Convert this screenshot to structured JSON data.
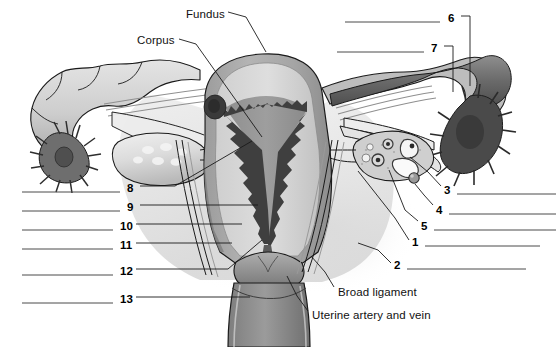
{
  "figure": {
    "type": "anatomy-worksheet-diagram",
    "palette": {
      "background": "#ffffff",
      "outline": "#1a1a1a",
      "tissue_light": "#e9e9e9",
      "tissue_midlight": "#d2d2d2",
      "tissue_mid": "#b0b0b0",
      "tissue_dark": "#8a8a8a",
      "tissue_darker": "#6d6d6d",
      "endometrium_dark": "#4a4a4a",
      "answer_line": "#4a4a4a",
      "leader_line": "#1a1a1a"
    }
  },
  "text_labels": [
    {
      "id": "fundus",
      "text": "Fundus",
      "x": 186,
      "y": 8
    },
    {
      "id": "corpus",
      "text": "Corpus",
      "x": 137,
      "y": 34
    },
    {
      "id": "broad-ligament",
      "text": "Broad ligament",
      "x": 338,
      "y": 286
    },
    {
      "id": "uterine-artery-and-vein",
      "text": "Uterine artery and vein",
      "x": 312,
      "y": 309
    }
  ],
  "numbered_labels": [
    {
      "number": "1",
      "x": 412,
      "y": 236,
      "side": "right"
    },
    {
      "number": "2",
      "x": 394,
      "y": 259,
      "side": "right"
    },
    {
      "number": "3",
      "x": 444,
      "y": 184,
      "side": "right"
    },
    {
      "number": "4",
      "x": 436,
      "y": 204,
      "side": "right"
    },
    {
      "number": "5",
      "x": 421,
      "y": 220,
      "side": "right"
    },
    {
      "number": "6",
      "x": 448,
      "y": 12,
      "side": "top-right"
    },
    {
      "number": "7",
      "x": 431,
      "y": 42,
      "side": "top-right"
    },
    {
      "number": "8",
      "x": 127,
      "y": 182,
      "side": "left"
    },
    {
      "number": "9",
      "x": 127,
      "y": 201,
      "side": "left"
    },
    {
      "number": "10",
      "x": 120,
      "y": 220,
      "side": "left"
    },
    {
      "number": "11",
      "x": 120,
      "y": 239,
      "side": "left"
    },
    {
      "number": "12",
      "x": 120,
      "y": 265,
      "side": "left"
    },
    {
      "number": "13",
      "x": 120,
      "y": 293,
      "side": "left"
    }
  ],
  "answer_lines": [
    {
      "for": "6",
      "x1": 345,
      "x2": 440,
      "y": 22
    },
    {
      "for": "7",
      "x1": 337,
      "x2": 424,
      "y": 52
    },
    {
      "for": "3",
      "x1": 457,
      "x2": 556,
      "y": 194
    },
    {
      "for": "4",
      "x1": 449,
      "x2": 556,
      "y": 214
    },
    {
      "for": "5",
      "x1": 434,
      "x2": 556,
      "y": 230
    },
    {
      "for": "1",
      "x1": 425,
      "x2": 540,
      "y": 246
    },
    {
      "for": "2",
      "x1": 407,
      "x2": 526,
      "y": 269
    },
    {
      "for": "8",
      "x1": 22,
      "x2": 120,
      "y": 192
    },
    {
      "for": "9",
      "x1": 22,
      "x2": 120,
      "y": 211
    },
    {
      "for": "10",
      "x1": 22,
      "x2": 113,
      "y": 230
    },
    {
      "for": "11",
      "x1": 22,
      "x2": 113,
      "y": 249
    },
    {
      "for": "12",
      "x1": 22,
      "x2": 113,
      "y": 275
    },
    {
      "for": "13",
      "x1": 22,
      "x2": 113,
      "y": 303
    }
  ],
  "leader_lines": [
    {
      "for": "fundus",
      "points": "228,12 246,17 266,52"
    },
    {
      "for": "corpus",
      "points": "179,39 196,44 262,137"
    },
    {
      "for": "broad-ligament",
      "points": "334,287 325,272 311,256"
    },
    {
      "for": "uterine-artery-and-vein",
      "points": "308,311 297,296 287,276"
    },
    {
      "for": "1",
      "points": "409,240 395,218 358,171"
    },
    {
      "for": "2",
      "points": "391,263 378,250 358,243"
    },
    {
      "for": "3",
      "points": "441,186 428,172 410,157"
    },
    {
      "for": "4",
      "points": "433,205 424,195 415,184"
    },
    {
      "for": "5",
      "points": "418,221 405,210 389,170"
    },
    {
      "for": "6",
      "points": "461,16 470,16 470,86"
    },
    {
      "for": "7",
      "points": "444,46 453,46 453,92"
    },
    {
      "for": "8",
      "points": "140,186 175,186 252,141"
    },
    {
      "for": "9",
      "points": "140,205 258,205"
    },
    {
      "for": "10",
      "points": "136,224 242,224"
    },
    {
      "for": "11",
      "points": "136,243 232,243"
    },
    {
      "for": "12",
      "points": "136,269 228,269 262,240"
    },
    {
      "for": "13",
      "points": "136,297 250,297"
    }
  ]
}
